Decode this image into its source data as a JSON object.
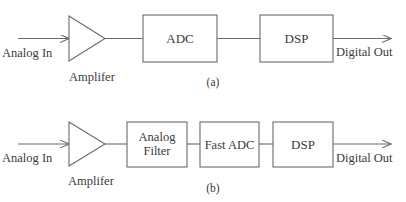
{
  "diagram": {
    "type": "block-diagram",
    "panels": [
      {
        "caption": "(a)",
        "input_label": "Analog In",
        "amplifier_label": "Amplifer",
        "blocks": [
          {
            "label": "ADC"
          },
          {
            "label": "DSP"
          }
        ],
        "output_label": "Digital Out"
      },
      {
        "caption": "(b)",
        "input_label": "Analog In",
        "amplifier_label": "Amplifer",
        "blocks": [
          {
            "label_line1": "Analog",
            "label_line2": "Filter"
          },
          {
            "label": "Fast ADC"
          },
          {
            "label": "DSP"
          }
        ],
        "output_label": "Digital Out"
      }
    ],
    "colors": {
      "line": "#6a6a6a",
      "text": "#3a3a3a",
      "background": "#ffffff"
    }
  }
}
